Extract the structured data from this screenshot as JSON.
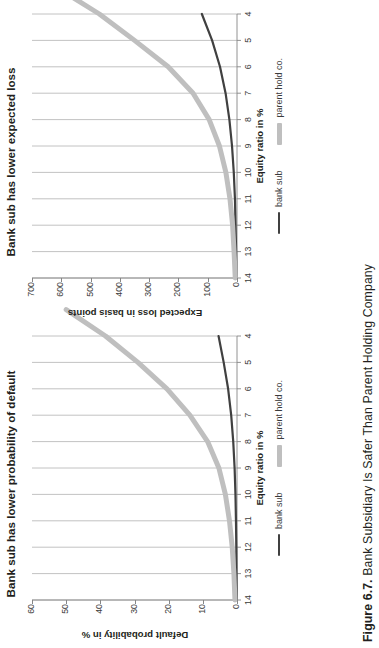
{
  "caption": {
    "number": "Figure 6.7.",
    "text": "Bank Subsidiary Is Safer Than Parent Holding Company"
  },
  "colors": {
    "bank_sub": "#404040",
    "parent_hold_co": "#bfbfbf",
    "axis": "#868686",
    "grid": "#b3b3b3",
    "text": "#231f20"
  },
  "legend": {
    "position": "bottom",
    "items": [
      {
        "label": "bank sub",
        "color": "#404040",
        "style": "thin"
      },
      {
        "label": "parent hold co.",
        "color": "#bfbfbf",
        "style": "thick"
      }
    ]
  },
  "chart_data": [
    {
      "id": "left",
      "type": "line",
      "title": "Bank sub has lower probability of default",
      "xlabel": "Equity ratio in %",
      "ylabel": "Default probability in %",
      "x": [
        14,
        13,
        12,
        11,
        10,
        9,
        8,
        7,
        6,
        5,
        4
      ],
      "xticks": [
        "14",
        "13",
        "12",
        "11",
        "10",
        "9",
        "8",
        "7",
        "6",
        "5",
        "4"
      ],
      "yticks": [
        "0",
        "10",
        "20",
        "30",
        "40",
        "50",
        "60"
      ],
      "xlim": [
        14,
        4
      ],
      "ylim": [
        0,
        60
      ],
      "x_reversed": true,
      "grid": "vertical",
      "series": [
        {
          "name": "bank sub",
          "color": "#404040",
          "values": [
            0.1,
            0.15,
            0.2,
            0.3,
            0.45,
            0.7,
            1.1,
            1.7,
            2.6,
            3.9,
            5.4
          ]
        },
        {
          "name": "parent hold co.",
          "color": "#bfbfbf",
          "values": [
            0.6,
            0.9,
            1.4,
            2.2,
            3.4,
            5.3,
            8.6,
            13.8,
            20.5,
            29.0,
            38.5,
            50.0
          ]
        }
      ]
    },
    {
      "id": "right",
      "type": "line",
      "title": "Bank sub has lower expected loss",
      "xlabel": "Equity ratio in %",
      "ylabel": "Expected loss in basis points",
      "x": [
        14,
        13,
        12,
        11,
        10,
        9,
        8,
        7,
        6,
        5,
        4
      ],
      "xticks": [
        "14",
        "13",
        "12",
        "11",
        "10",
        "9",
        "8",
        "7",
        "6",
        "5",
        "4"
      ],
      "yticks": [
        "0",
        "100",
        "200",
        "300",
        "400",
        "500",
        "600",
        "700"
      ],
      "xlim": [
        14,
        4
      ],
      "ylim": [
        0,
        700
      ],
      "x_reversed": true,
      "grid": "vertical",
      "series": [
        {
          "name": "bank sub",
          "color": "#404040",
          "values": [
            2,
            3,
            5,
            7,
            11,
            17,
            26,
            39,
            58,
            85,
            120
          ]
        },
        {
          "name": "parent hold co.",
          "color": "#bfbfbf",
          "values": [
            6,
            10,
            15,
            24,
            38,
            60,
            95,
            150,
            235,
            350,
            470,
            615
          ]
        }
      ]
    }
  ]
}
